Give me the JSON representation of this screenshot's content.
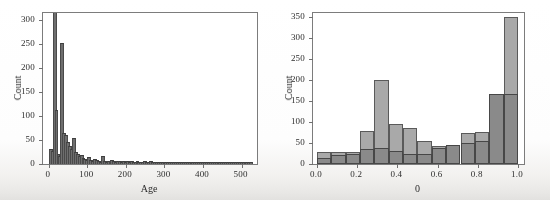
{
  "figure": {
    "name": "two-panel-histogram-figure",
    "background_color": "#ffffff",
    "ink_color": "#2e2e2e"
  },
  "chart_data": [
    {
      "type": "bar",
      "name": "age-histogram",
      "title": "",
      "xlabel": "Age",
      "ylabel": "Count",
      "xlim": [
        -15,
        540
      ],
      "ylim": [
        0,
        315
      ],
      "grid": false,
      "legend": false,
      "xticks": [
        0,
        100,
        200,
        300,
        400,
        500
      ],
      "xticklabels": [
        "0",
        "100",
        "200",
        "300",
        "400",
        "500"
      ],
      "yticks": [
        0,
        50,
        100,
        150,
        200,
        250,
        300
      ],
      "yticklabels": [
        "0",
        "50",
        "100",
        "150",
        "200",
        "250",
        "300"
      ],
      "bin_width": 5,
      "bar_color": "#6e6e6e",
      "categories": [
        0,
        5,
        10,
        15,
        20,
        25,
        30,
        35,
        40,
        45,
        50,
        55,
        60,
        65,
        70,
        75,
        80,
        85,
        90,
        95,
        100,
        105,
        110,
        115,
        120,
        125,
        130,
        135,
        140,
        145,
        150,
        155,
        160,
        165,
        170,
        175,
        180,
        185,
        190,
        195,
        200,
        205,
        210,
        215,
        220,
        225,
        230,
        235,
        240,
        245,
        250,
        255,
        260,
        265,
        270,
        275,
        280,
        285,
        290,
        295,
        300,
        305,
        310,
        315,
        320,
        325,
        330,
        335,
        340,
        345,
        350,
        355,
        360,
        365,
        370,
        375,
        380,
        385,
        390,
        395,
        400,
        405,
        410,
        415,
        420,
        425,
        430,
        435,
        440,
        445,
        450,
        455,
        460,
        465,
        470,
        475,
        480,
        485,
        490,
        495,
        500,
        505,
        510,
        515,
        520
      ],
      "values": [
        30,
        26,
        315,
        110,
        18,
        14,
        250,
        62,
        58,
        44,
        36,
        30,
        52,
        22,
        18,
        14,
        16,
        10,
        8,
        7,
        12,
        6,
        5,
        9,
        7,
        4,
        3,
        14,
        4,
        3,
        5,
        4,
        6,
        4,
        3,
        5,
        4,
        3,
        4,
        3,
        5,
        3,
        4,
        2,
        3,
        4,
        3,
        2,
        3,
        4,
        2,
        3,
        4,
        2,
        2,
        3,
        2,
        3,
        2,
        2,
        3,
        2,
        2,
        1,
        2,
        2,
        1,
        2,
        1,
        2,
        1,
        1,
        2,
        1,
        1,
        2,
        1,
        1,
        1,
        1,
        2,
        1,
        1,
        1,
        1,
        1,
        1,
        1,
        1,
        1,
        1,
        1,
        1,
        1,
        1,
        1,
        1,
        1,
        1,
        1,
        2,
        1,
        1,
        1,
        2
      ]
    },
    {
      "type": "bar",
      "name": "theta-histogram",
      "title": "",
      "xlabel": "0",
      "ylabel": "Count",
      "xlim": [
        -0.02,
        1.03
      ],
      "ylim": [
        0,
        360
      ],
      "grid": false,
      "legend": false,
      "xticks": [
        0.0,
        0.2,
        0.4,
        0.6,
        0.8,
        1.0
      ],
      "xticklabels": [
        "0.0",
        "0.2",
        "0.4",
        "0.6",
        "0.8",
        "1.0"
      ],
      "yticks": [
        0,
        50,
        100,
        150,
        200,
        250,
        300,
        350
      ],
      "yticklabels": [
        "0",
        "50",
        "100",
        "150",
        "200",
        "250",
        "300",
        "350"
      ],
      "bin_width": 0.0714,
      "bin_edges": [
        0.0,
        0.0714,
        0.1428,
        0.2142,
        0.2856,
        0.357,
        0.4284,
        0.4998,
        0.5712,
        0.6426,
        0.714,
        0.7854,
        0.8568,
        0.9282,
        1.0
      ],
      "categories": [
        "0.00-0.07",
        "0.07-0.14",
        "0.14-0.21",
        "0.21-0.29",
        "0.29-0.36",
        "0.36-0.43",
        "0.43-0.50",
        "0.50-0.57",
        "0.57-0.64",
        "0.64-0.71",
        "0.71-0.79",
        "0.79-0.86",
        "0.86-0.93",
        "0.93-1.00"
      ],
      "series": [
        {
          "name": "light-series",
          "color": "#a9a9a9",
          "values": [
            29,
            29,
            29,
            78,
            201,
            96,
            87,
            56,
            44,
            45,
            75,
            77,
            142,
            350
          ]
        },
        {
          "name": "dark-series",
          "color": "#8a8a8a",
          "values": [
            15,
            22,
            23,
            36,
            37,
            31,
            23,
            24,
            38,
            46,
            50,
            54,
            166,
            166
          ]
        }
      ]
    }
  ]
}
